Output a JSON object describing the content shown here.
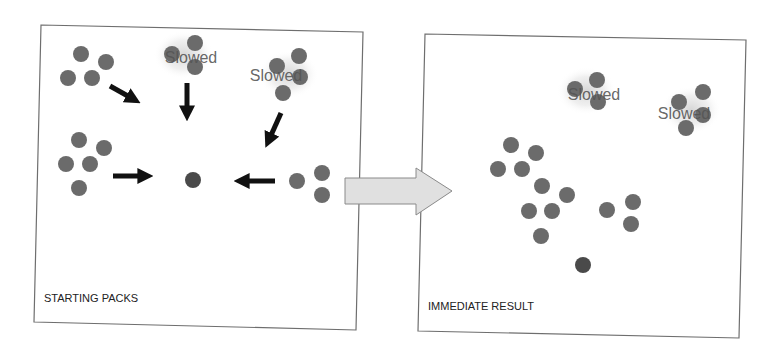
{
  "colors": {
    "background": "#ffffff",
    "frame": "#6e6e6e",
    "unit": "#6b6b6b",
    "target": "#4a4a4a",
    "arrow": "#111111",
    "transition_arrow_fill": "#e0e0e0",
    "transition_arrow_stroke": "#8a8a8a",
    "slowed_text": "#555555",
    "panel_label": "#222222"
  },
  "panels": [
    {
      "id": "starting-packs",
      "label": "STARTING PACKS",
      "frame": [
        [
          41,
          25
        ],
        [
          363,
          32
        ],
        [
          356,
          330
        ],
        [
          34,
          322
        ]
      ],
      "label_pos": [
        44,
        302
      ],
      "target": {
        "cx": 193,
        "cy": 180,
        "r": 8
      },
      "packs": [
        {
          "name": "pack-top-left",
          "slowed": false,
          "units": [
            [
              81,
              54
            ],
            [
              106,
              62
            ],
            [
              68,
              78
            ],
            [
              92,
              78
            ]
          ]
        },
        {
          "name": "pack-top-center",
          "slowed": true,
          "label": "Slowed",
          "label_pos": [
            191,
            63
          ],
          "units": [
            [
              172,
              54
            ],
            [
              195,
              43
            ],
            [
              195,
              67
            ]
          ]
        },
        {
          "name": "pack-top-right",
          "slowed": true,
          "label": "Slowed",
          "label_pos": [
            276,
            81
          ],
          "units": [
            [
              299,
              56
            ],
            [
              277,
              66
            ],
            [
              300,
              77
            ],
            [
              283,
              93
            ]
          ]
        },
        {
          "name": "pack-left",
          "slowed": false,
          "units": [
            [
              79,
              140
            ],
            [
              104,
              148
            ],
            [
              66,
              164
            ],
            [
              90,
              164
            ],
            [
              79,
              188
            ]
          ]
        },
        {
          "name": "pack-right",
          "slowed": false,
          "units": [
            [
              297,
              181
            ],
            [
              322,
              173
            ],
            [
              322,
              195
            ]
          ]
        }
      ],
      "arrows": [
        {
          "name": "arrow-from-top-left",
          "from": [
            110,
            86
          ],
          "to": [
            135,
            100
          ]
        },
        {
          "name": "arrow-from-top-center",
          "from": [
            187,
            83
          ],
          "to": [
            187,
            115
          ]
        },
        {
          "name": "arrow-from-top-right",
          "from": [
            281,
            113
          ],
          "to": [
            268,
            142
          ]
        },
        {
          "name": "arrow-from-left",
          "from": [
            113,
            176
          ],
          "to": [
            147,
            176
          ]
        },
        {
          "name": "arrow-from-right",
          "from": [
            275,
            181
          ],
          "to": [
            240,
            181
          ]
        }
      ]
    },
    {
      "id": "immediate-result",
      "label": "IMMEDIATE RESULT",
      "frame": [
        [
          425,
          34
        ],
        [
          746,
          40
        ],
        [
          739,
          338
        ],
        [
          418,
          331
        ]
      ],
      "label_pos": [
        428,
        310
      ],
      "target": {
        "cx": 583,
        "cy": 265,
        "r": 8
      },
      "packs": [
        {
          "name": "pack-slowed-a",
          "slowed": true,
          "label": "Slowed",
          "label_pos": [
            594,
            100
          ],
          "units": [
            [
              575,
              89
            ],
            [
              597,
              80
            ],
            [
              598,
              102
            ]
          ]
        },
        {
          "name": "pack-slowed-b",
          "slowed": true,
          "label": "Slowed",
          "label_pos": [
            684,
            119
          ],
          "units": [
            [
              703,
              92
            ],
            [
              679,
              102
            ],
            [
              703,
              115
            ],
            [
              686,
              128
            ]
          ]
        },
        {
          "name": "pack-merged-a",
          "slowed": false,
          "units": [
            [
              511,
              145
            ],
            [
              536,
              153
            ],
            [
              498,
              169
            ],
            [
              522,
              169
            ]
          ]
        },
        {
          "name": "pack-merged-b",
          "slowed": false,
          "units": [
            [
              542,
              186
            ],
            [
              567,
              195
            ],
            [
              529,
              211
            ],
            [
              552,
              211
            ],
            [
              541,
              236
            ]
          ]
        },
        {
          "name": "pack-merged-c",
          "slowed": false,
          "units": [
            [
              607,
              210
            ],
            [
              633,
              202
            ],
            [
              631,
              224
            ]
          ]
        }
      ],
      "arrows": []
    }
  ],
  "transition_arrow": {
    "points": [
      [
        345,
        178
      ],
      [
        416,
        178
      ],
      [
        416,
        168
      ],
      [
        452,
        191
      ],
      [
        416,
        215
      ],
      [
        416,
        204
      ],
      [
        345,
        204
      ]
    ]
  },
  "unit_radius": 8
}
